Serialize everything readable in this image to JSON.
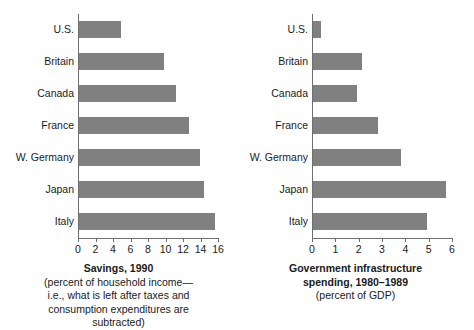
{
  "chart_data": [
    {
      "type": "bar",
      "orientation": "horizontal",
      "id": "savings-1990",
      "title": "Savings, 1990",
      "subtitle_lines": [
        "(percent of household income—",
        "i.e., what is left after taxes and",
        "consumption expenditures are",
        "subtracted)"
      ],
      "categories": [
        "U.S.",
        "Britain",
        "Canada",
        "France",
        "W. Germany",
        "Japan",
        "Italy"
      ],
      "values": [
        4.8,
        9.7,
        11.1,
        12.6,
        13.8,
        14.3,
        15.5
      ],
      "xlabel": "",
      "ylabel": "",
      "xlim": [
        0,
        16
      ],
      "xticks": [
        0,
        2,
        4,
        6,
        8,
        10,
        12,
        14,
        16
      ],
      "xtick_labels": [
        "0",
        "2",
        "4",
        "6",
        "8",
        "10",
        "12",
        "14",
        "16"
      ],
      "grid": false,
      "legend": false,
      "bar_color": "#808080",
      "axis_color": "#6f6f6f"
    },
    {
      "type": "bar",
      "orientation": "horizontal",
      "id": "gov-infrastructure-spending",
      "title": "Government infrastructure",
      "title_line2": "spending, 1980–1989",
      "subtitle_lines": [
        "(percent of GDP)"
      ],
      "categories": [
        "U.S.",
        "Britain",
        "Canada",
        "France",
        "W. Germany",
        "Japan",
        "Italy"
      ],
      "values": [
        0.35,
        2.1,
        1.9,
        2.8,
        3.75,
        5.7,
        4.9
      ],
      "xlabel": "",
      "ylabel": "",
      "xlim": [
        0,
        6
      ],
      "xticks": [
        0,
        1,
        2,
        3,
        4,
        5,
        6
      ],
      "xtick_labels": [
        "0",
        "1",
        "2",
        "3",
        "4",
        "5",
        "6"
      ],
      "grid": false,
      "legend": false,
      "bar_color": "#808080",
      "axis_color": "#6f6f6f"
    }
  ]
}
